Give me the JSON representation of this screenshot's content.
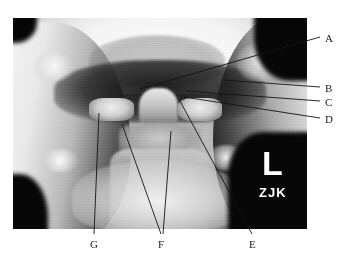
{
  "figure": {
    "type": "radiograph",
    "view": "open-mouth odontoid (AP) cervical spine",
    "width": 346,
    "height": 261,
    "background_color": "#ffffff"
  },
  "image_markers": {
    "laterality": "L",
    "laterality_meaning": "left side marker",
    "technologist_initials": "ZJK",
    "marker_color": "#ffffff"
  },
  "annotations": {
    "line_color": "#141414",
    "label_color": "#1a1a1a",
    "items": [
      {
        "id": "A",
        "label": "A",
        "label_x": 325,
        "label_y": 33,
        "leader": [
          {
            "x": 320,
            "y": 37
          },
          {
            "x": 140,
            "y": 89
          }
        ]
      },
      {
        "id": "B",
        "label": "B",
        "label_x": 325,
        "label_y": 83,
        "leader": [
          {
            "x": 320,
            "y": 87
          },
          {
            "x": 224,
            "y": 80
          }
        ]
      },
      {
        "id": "C",
        "label": "C",
        "label_x": 325,
        "label_y": 97,
        "leader": [
          {
            "x": 320,
            "y": 101
          },
          {
            "x": 186,
            "y": 91
          }
        ]
      },
      {
        "id": "D",
        "label": "D",
        "label_x": 325,
        "label_y": 114,
        "leader": [
          {
            "x": 320,
            "y": 118
          },
          {
            "x": 184,
            "y": 97
          }
        ]
      },
      {
        "id": "E",
        "label": "E",
        "label_x": 249,
        "label_y": 239,
        "leader": [
          {
            "x": 252,
            "y": 234
          },
          {
            "x": 180,
            "y": 101
          }
        ]
      },
      {
        "id": "F",
        "label": "F",
        "label_x": 158,
        "label_y": 239,
        "leader": [
          {
            "x": 161,
            "y": 234
          },
          {
            "x": 122,
            "y": 124
          }
        ],
        "leader2": [
          {
            "x": 163,
            "y": 234
          },
          {
            "x": 171,
            "y": 131
          }
        ]
      },
      {
        "id": "G",
        "label": "G",
        "label_x": 90,
        "label_y": 239,
        "leader": [
          {
            "x": 94,
            "y": 234
          },
          {
            "x": 99,
            "y": 113
          }
        ]
      }
    ]
  }
}
